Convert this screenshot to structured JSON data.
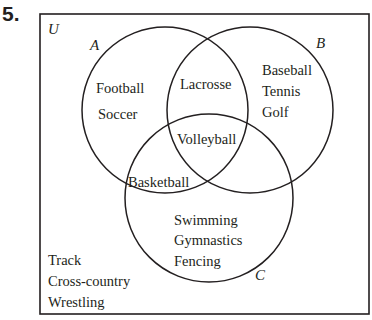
{
  "problem_number": "5.",
  "diagram": {
    "universe_label": "U",
    "sets": [
      {
        "name": "A",
        "cx": 165,
        "cy": 110,
        "r": 83
      },
      {
        "name": "B",
        "cx": 250,
        "cy": 110,
        "r": 83
      },
      {
        "name": "C",
        "cx": 209,
        "cy": 198,
        "r": 84
      }
    ],
    "regions": {
      "A_only": [
        "Football",
        "Soccer"
      ],
      "A_and_B_only": [
        "Lacrosse"
      ],
      "B_only": [
        "Baseball",
        "Tennis",
        "Golf"
      ],
      "A_and_B_and_C": [
        "Volleyball"
      ],
      "A_and_C_only": [
        "Basketball"
      ],
      "C_only": [
        "Swimming",
        "Gymnastics",
        "Fencing"
      ],
      "outside": [
        "Track",
        "Cross-country",
        "Wrestling"
      ]
    }
  }
}
